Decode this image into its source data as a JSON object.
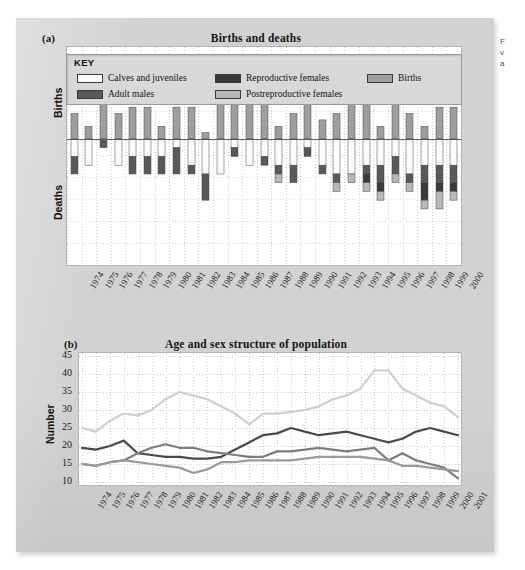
{
  "margin_note": {
    "lines": [
      "F",
      "v",
      "a"
    ]
  },
  "figure": {
    "panel_a": {
      "label": "(a)",
      "title": "Births and deaths",
      "y_axis_upper": "Births",
      "y_axis_lower": "Deaths"
    },
    "panel_b": {
      "label": "(b)",
      "title": "Age and sex structure of population",
      "y_axis": "Number"
    }
  },
  "legend": {
    "title": "KEY",
    "items": [
      {
        "label": "Calves and juveniles",
        "color": "#fbfbfb"
      },
      {
        "label": "Reproductive females",
        "color": "#3a3a3a"
      },
      {
        "label": "Births",
        "color": "#9e9e9e"
      },
      {
        "label": "Adult males",
        "color": "#595959"
      },
      {
        "label": "Postreproductive females",
        "color": "#b8b8b8"
      }
    ]
  },
  "chart_data": [
    {
      "type": "bar",
      "title": "Births and deaths",
      "subtitle": "(a)",
      "xlabel": "",
      "ylabel": "Births / Deaths",
      "stacked": true,
      "diverging": true,
      "grid": true,
      "legend_position": "top",
      "ylim": [
        -14,
        14
      ],
      "categories": [
        "1974",
        "1975",
        "1976",
        "1977",
        "1978",
        "1979",
        "1980",
        "1981",
        "1982",
        "1983",
        "1984",
        "1985",
        "1986",
        "1987",
        "1988",
        "1989",
        "1990",
        "1991",
        "1992",
        "1993",
        "1994",
        "1995",
        "1996",
        "1997",
        "1998",
        "1999",
        "2000"
      ],
      "series": [
        {
          "name": "Births",
          "direction": "up",
          "color": "#9e9e9e",
          "values": [
            4,
            2,
            13,
            4,
            5,
            5,
            2,
            5,
            5,
            1,
            7,
            9,
            11,
            6,
            2,
            4,
            11,
            3,
            4,
            8,
            6,
            2,
            9,
            4,
            2,
            5,
            5
          ]
        },
        {
          "name": "Calves and juveniles",
          "direction": "down",
          "color": "#fbfbfb",
          "values": [
            2,
            3,
            0,
            3,
            2,
            2,
            2,
            1,
            3,
            4,
            4,
            1,
            3,
            2,
            3,
            3,
            1,
            3,
            4,
            4,
            3,
            3,
            2,
            4,
            3,
            3,
            3
          ]
        },
        {
          "name": "Adult males",
          "direction": "down",
          "color": "#595959",
          "values": [
            2,
            0,
            1,
            0,
            2,
            2,
            2,
            3,
            1,
            3,
            0,
            1,
            0,
            1,
            1,
            2,
            1,
            1,
            1,
            0,
            1,
            2,
            2,
            1,
            2,
            2,
            2
          ]
        },
        {
          "name": "Reproductive females",
          "direction": "down",
          "color": "#3a3a3a",
          "values": [
            0,
            0,
            0,
            0,
            0,
            0,
            0,
            0,
            0,
            0,
            0,
            0,
            0,
            0,
            0,
            0,
            0,
            0,
            0,
            0,
            1,
            1,
            0,
            0,
            2,
            1,
            1
          ]
        },
        {
          "name": "Postreproductive females",
          "direction": "down",
          "color": "#b8b8b8",
          "values": [
            0,
            0,
            0,
            0,
            0,
            0,
            0,
            0,
            0,
            0,
            0,
            0,
            0,
            0,
            1,
            0,
            0,
            0,
            1,
            1,
            1,
            1,
            1,
            1,
            1,
            2,
            1
          ]
        }
      ]
    },
    {
      "type": "line",
      "title": "Age and sex structure of population",
      "subtitle": "(b)",
      "xlabel": "",
      "ylabel": "Number",
      "grid": true,
      "ylim": [
        10,
        45
      ],
      "yticks": [
        10,
        15,
        20,
        25,
        30,
        35,
        40,
        45
      ],
      "x": [
        "1974",
        "1975",
        "1976",
        "1977",
        "1978",
        "1979",
        "1980",
        "1981",
        "1982",
        "1983",
        "1984",
        "1985",
        "1986",
        "1987",
        "1988",
        "1989",
        "1990",
        "1991",
        "1992",
        "1993",
        "1994",
        "1995",
        "1996",
        "1997",
        "1998",
        "1999",
        "2000",
        "2001"
      ],
      "series": [
        {
          "name": "Calves and juveniles",
          "color": "#cfcfcf",
          "values": [
            25,
            24,
            27,
            29,
            28.5,
            30,
            33,
            35,
            34,
            33,
            31,
            29,
            26,
            29,
            29,
            29.5,
            30,
            31,
            33,
            34,
            36,
            41,
            41,
            36,
            34,
            32,
            31,
            28
          ]
        },
        {
          "name": "Reproductive females",
          "color": "#4a4a4a",
          "values": [
            19.5,
            19,
            20,
            21.5,
            18,
            17.5,
            17,
            17,
            16.5,
            16.5,
            17,
            19,
            21,
            23,
            23.5,
            25,
            24,
            23,
            23.5,
            24,
            23,
            22,
            21,
            22,
            24,
            25,
            24,
            23
          ]
        },
        {
          "name": "Adult males",
          "color": "#7d7d7d",
          "values": [
            15,
            14.5,
            15.5,
            16,
            18,
            19.5,
            20.5,
            19.5,
            19.5,
            18.5,
            18,
            17.5,
            17,
            17,
            18.5,
            18.5,
            19,
            19.5,
            19,
            18.5,
            19,
            19.5,
            16,
            18,
            16,
            15,
            14,
            11
          ]
        },
        {
          "name": "Postreproductive females",
          "color": "#9a9a9a",
          "values": [
            15,
            14.5,
            15.5,
            16,
            15.5,
            15,
            14.5,
            14,
            12.5,
            13.5,
            15.5,
            15.5,
            16,
            16,
            16,
            16,
            16.5,
            17,
            17,
            17,
            17,
            16.5,
            16,
            14.5,
            14.5,
            14,
            13.5,
            13
          ]
        }
      ]
    }
  ]
}
